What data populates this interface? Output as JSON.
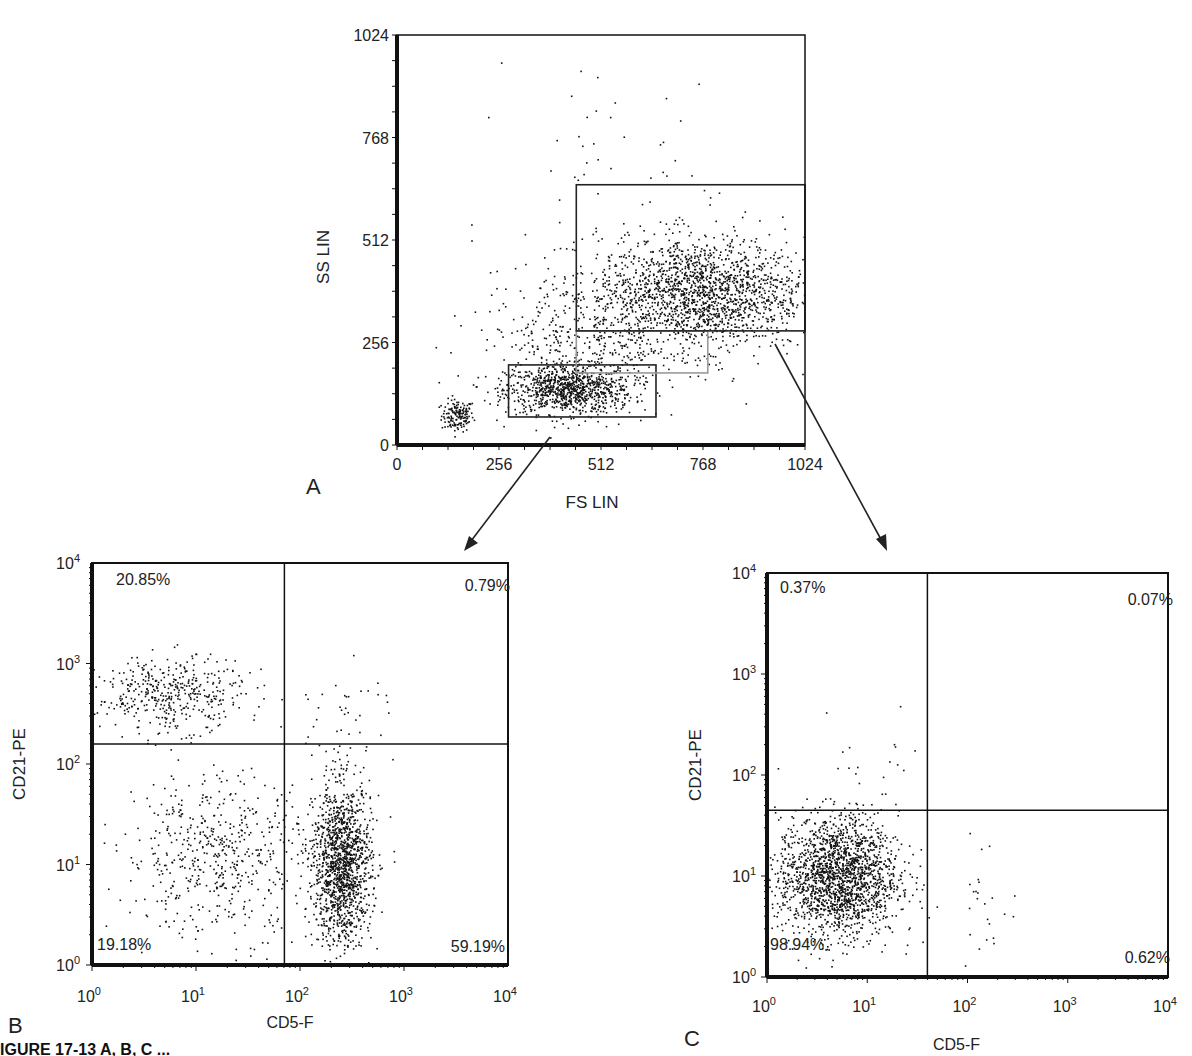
{
  "figure": {
    "caption_fragment": "IGURE 17-13 A, B, C ...",
    "panel_letters": [
      "A",
      "B",
      "C"
    ]
  },
  "chart_data": [
    {
      "panel": "A",
      "type": "scatter",
      "title": "",
      "xlabel": "FS LIN",
      "ylabel": "SS LIN",
      "xlim": [
        0,
        1024
      ],
      "ylim": [
        0,
        1024
      ],
      "x_ticks": [
        "0",
        "256",
        "512",
        "768",
        "1024"
      ],
      "y_ticks": [
        "0",
        "256",
        "512",
        "768",
        "1024"
      ],
      "grid": false,
      "gates": [
        {
          "name": "lymphocyte-gate",
          "x": [
            280,
            650
          ],
          "y": [
            70,
            200
          ],
          "color": "#222222"
        },
        {
          "name": "intermediate-gate",
          "x": [
            450,
            780
          ],
          "y": [
            180,
            285
          ],
          "color": "#999999"
        },
        {
          "name": "large-cell-gate",
          "x": [
            450,
            1024
          ],
          "y": [
            285,
            650
          ],
          "color": "#222222"
        }
      ],
      "clusters": [
        {
          "name": "debris",
          "center": [
            150,
            75
          ],
          "spread": [
            20,
            20
          ],
          "count": 150
        },
        {
          "name": "small-cells",
          "center": [
            430,
            140
          ],
          "spread": [
            80,
            30
          ],
          "count": 900
        },
        {
          "name": "large-cells",
          "center": [
            760,
            380
          ],
          "spread": [
            130,
            70
          ],
          "count": 1800
        },
        {
          "name": "scatter-bridge",
          "center": [
            460,
            260
          ],
          "spread": [
            130,
            90
          ],
          "count": 450
        },
        {
          "name": "outliers",
          "center": [
            600,
            700
          ],
          "spread": [
            150,
            160
          ],
          "count": 50
        }
      ]
    },
    {
      "panel": "B",
      "type": "scatter",
      "title": "",
      "xlabel": "CD5-F",
      "ylabel": "CD21-PE",
      "xscale": "log",
      "yscale": "log",
      "xlim": [
        1,
        10000
      ],
      "ylim": [
        1,
        10000
      ],
      "x_ticks": [
        "10^0",
        "10^1",
        "10^2",
        "10^3",
        "10^4"
      ],
      "y_ticks": [
        "10^0",
        "10^1",
        "10^2",
        "10^3",
        "10^4"
      ],
      "quadrant_divider": {
        "x_log": 1.85,
        "y_log": 2.2
      },
      "quadrants": {
        "upper_left": "20.85%",
        "upper_right": "0.79%",
        "lower_left": "19.18%",
        "lower_right": "59.19%"
      },
      "clusters": [
        {
          "name": "CD21+ B cells",
          "center_log": [
            0.75,
            2.7
          ],
          "spread_log": [
            0.35,
            0.18
          ],
          "count": 420
        },
        {
          "name": "double negative",
          "center_log": [
            1.2,
            1.1
          ],
          "spread_log": [
            0.45,
            0.4
          ],
          "count": 550
        },
        {
          "name": "CD5+ T cells",
          "center_log": [
            2.4,
            1.0
          ],
          "spread_log": [
            0.14,
            0.4
          ],
          "count": 1400
        },
        {
          "name": "double positive",
          "center_log": [
            2.4,
            2.5
          ],
          "spread_log": [
            0.25,
            0.25
          ],
          "count": 40
        }
      ]
    },
    {
      "panel": "C",
      "type": "scatter",
      "title": "",
      "xlabel": "CD5-F",
      "ylabel": "CD21-PE",
      "xscale": "log",
      "yscale": "log",
      "xlim": [
        1,
        10000
      ],
      "ylim": [
        1,
        10000
      ],
      "x_ticks": [
        "10^0",
        "10^1",
        "10^2",
        "10^3",
        "10^4"
      ],
      "y_ticks": [
        "10^0",
        "10^1",
        "10^2",
        "10^3",
        "10^4"
      ],
      "quadrant_divider": {
        "x_log": 1.6,
        "y_log": 1.65
      },
      "quadrants": {
        "upper_left": "0.37%",
        "upper_right": "0.07%",
        "lower_left": "98.94%",
        "lower_right": "0.62%"
      },
      "clusters": [
        {
          "name": "double negative",
          "center_log": [
            0.7,
            1.0
          ],
          "spread_log": [
            0.3,
            0.3
          ],
          "count": 1900
        },
        {
          "name": "CD21+",
          "center_log": [
            1.0,
            2.1
          ],
          "spread_log": [
            0.3,
            0.35
          ],
          "count": 15
        },
        {
          "name": "CD5+",
          "center_log": [
            2.2,
            0.8
          ],
          "spread_log": [
            0.15,
            0.35
          ],
          "count": 25
        }
      ]
    }
  ]
}
